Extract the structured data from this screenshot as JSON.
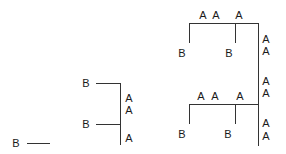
{
  "diagram": {
    "stroke_color": "#333333",
    "text_color": "#1a1a1a",
    "labels": [
      {
        "id": "b-left-bottom",
        "text": "B",
        "x": 16,
        "y": 143
      },
      {
        "id": "b-mid-top",
        "text": "B",
        "x": 86,
        "y": 83
      },
      {
        "id": "b-mid-bottom",
        "text": "B",
        "x": 86,
        "y": 124
      },
      {
        "id": "a-mid-1",
        "text": "A",
        "x": 129,
        "y": 98
      },
      {
        "id": "a-mid-2",
        "text": "A",
        "x": 129,
        "y": 110
      },
      {
        "id": "a-mid-3",
        "text": "A",
        "x": 129,
        "y": 138
      },
      {
        "id": "a-top-1",
        "text": "A",
        "x": 203,
        "y": 15
      },
      {
        "id": "a-top-2",
        "text": "A",
        "x": 216,
        "y": 15
      },
      {
        "id": "a-top-3",
        "text": "A",
        "x": 239,
        "y": 15
      },
      {
        "id": "b-top-left",
        "text": "B",
        "x": 182,
        "y": 53
      },
      {
        "id": "b-top-right",
        "text": "B",
        "x": 229,
        "y": 53
      },
      {
        "id": "a-right-1",
        "text": "A",
        "x": 266,
        "y": 39
      },
      {
        "id": "a-right-2",
        "text": "A",
        "x": 266,
        "y": 51
      },
      {
        "id": "a-right-3",
        "text": "A",
        "x": 266,
        "y": 81
      },
      {
        "id": "a-right-4",
        "text": "A",
        "x": 266,
        "y": 93
      },
      {
        "id": "a-right-5",
        "text": "A",
        "x": 266,
        "y": 123
      },
      {
        "id": "a-right-6",
        "text": "A",
        "x": 266,
        "y": 136
      },
      {
        "id": "a-low-1",
        "text": "A",
        "x": 201,
        "y": 96
      },
      {
        "id": "a-low-2",
        "text": "A",
        "x": 215,
        "y": 96
      },
      {
        "id": "a-low-3",
        "text": "A",
        "x": 240,
        "y": 96
      },
      {
        "id": "b-low-left",
        "text": "B",
        "x": 182,
        "y": 134
      },
      {
        "id": "b-low-right",
        "text": "B",
        "x": 228,
        "y": 134
      }
    ]
  }
}
